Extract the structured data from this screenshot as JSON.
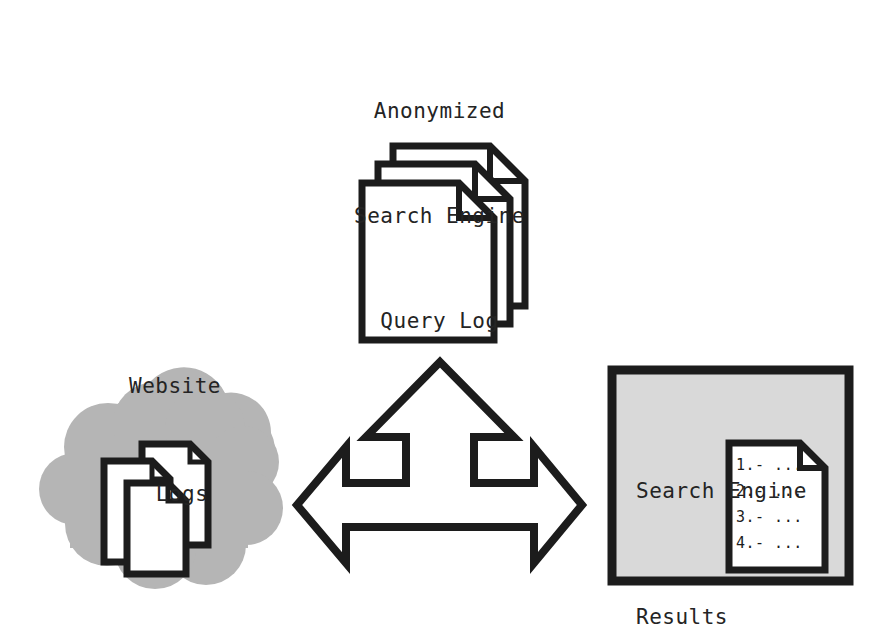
{
  "diagram": {
    "background_color": "#ffffff",
    "stroke_color": "#1c1c1c",
    "cloud_fill": "#b5b5b5",
    "panel_fill": "#d9d9d9",
    "paper_fill": "#ffffff"
  },
  "query_log": {
    "line1": "Anonymized",
    "line2": "Search Engine",
    "line3": "Query Log",
    "icon": "document-stack-icon"
  },
  "website_logs": {
    "line1": "Website",
    "line2": "Logs",
    "cloud_icon": "cloud-icon",
    "documents_icon": "document-stack-icon"
  },
  "flow_arrow": {
    "icon": "three-way-arrow-icon",
    "directions": [
      "up",
      "left",
      "right"
    ]
  },
  "results_panel": {
    "line1": "Search Engine",
    "line2": "Results",
    "document_icon": "document-icon",
    "items": [
      "1.- ...",
      "2.- ...",
      "3.- ...",
      "4.- ..."
    ]
  }
}
